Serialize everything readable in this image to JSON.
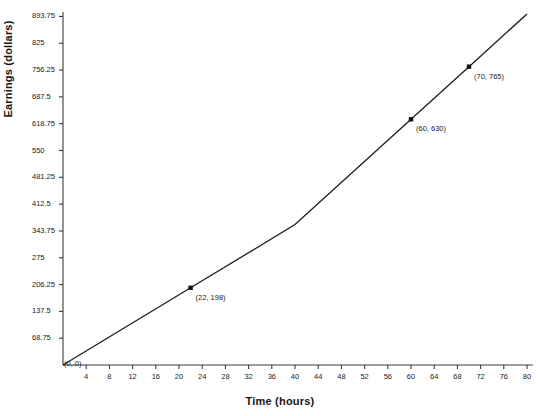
{
  "chart_data": {
    "type": "line",
    "title": "",
    "xlabel": "Time (hours)",
    "ylabel": "Earnings (dollars)",
    "xlim": [
      0,
      80
    ],
    "ylim": [
      0,
      900
    ],
    "grid": false,
    "legend": null,
    "x_ticks": [
      4,
      8,
      12,
      16,
      20,
      24,
      28,
      32,
      36,
      40,
      44,
      48,
      52,
      56,
      60,
      64,
      68,
      72,
      76,
      80
    ],
    "y_ticks": [
      68.75,
      137.5,
      206.25,
      275,
      343.75,
      412.5,
      481.25,
      550,
      618.75,
      687.5,
      756.25,
      825,
      893.75
    ],
    "y_tick_labels": [
      "68.75",
      "137.5",
      "206.25",
      "275",
      "343.75",
      "412.5",
      "481.25",
      "550",
      "618.75",
      "687.5",
      "756.25",
      "825",
      "893.75"
    ],
    "x_tick_labels": [
      "4",
      "8",
      "12",
      "16",
      "20",
      "24",
      "28",
      "32",
      "36",
      "40",
      "44",
      "48",
      "52",
      "56",
      "60",
      "64",
      "68",
      "72",
      "76",
      "80"
    ],
    "series": [
      {
        "name": "Earnings",
        "x": [
          0,
          22,
          40,
          60,
          70,
          80
        ],
        "values": [
          0,
          198,
          360,
          630,
          765,
          900
        ]
      }
    ],
    "markers": [
      {
        "x": 0,
        "y": 0,
        "label": "(0, 0)"
      },
      {
        "x": 22,
        "y": 198,
        "label": "(22, 198)"
      },
      {
        "x": 60,
        "y": 630,
        "label": "(60, 630)"
      },
      {
        "x": 70,
        "y": 765,
        "label": "(70, 765)"
      }
    ],
    "line_color": "#1c1c1c",
    "axis_color": "#3a3a3a",
    "marker_color": "#111111"
  }
}
